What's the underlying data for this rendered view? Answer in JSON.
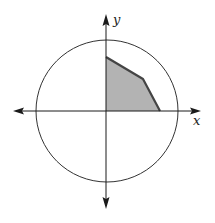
{
  "diagram": {
    "type": "coordinate-plane-with-circle-and-shaded-region",
    "axes": {
      "x_label": "x",
      "y_label": "y"
    },
    "colors": {
      "stroke": "#1a1a1a",
      "circle": "#333333",
      "region_fill": "#b3b3b3",
      "region_edge": "#444444",
      "background": "#ffffff"
    },
    "circle": {
      "center": [
        107,
        111
      ],
      "radius": 71
    },
    "shaded_region": {
      "quadrant": "I",
      "vertices": [
        [
          106,
          111
        ],
        [
          106,
          57
        ],
        [
          143,
          79
        ],
        [
          160,
          111
        ]
      ]
    }
  }
}
